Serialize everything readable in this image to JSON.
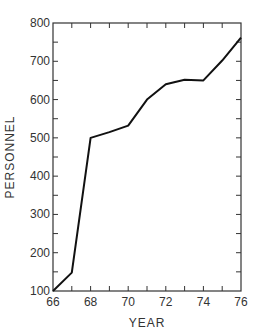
{
  "chart_data": {
    "type": "line",
    "title": "",
    "xlabel": "YEAR",
    "ylabel": "PERSONNEL",
    "x": [
      66,
      67,
      68,
      69,
      70,
      71,
      72,
      73,
      74,
      75,
      76
    ],
    "series": [
      {
        "name": "Personnel",
        "values": [
          100,
          148,
          500,
          515,
          532,
          600,
          640,
          652,
          650,
          702,
          762
        ]
      }
    ],
    "xlim": [
      66,
      76
    ],
    "ylim": [
      100,
      800
    ],
    "x_ticks": [
      "66",
      "68",
      "70",
      "72",
      "74",
      "76"
    ],
    "y_ticks": [
      "100",
      "200",
      "300",
      "400",
      "500",
      "600",
      "700",
      "800"
    ],
    "grid": false,
    "legend": "none",
    "line_color": "#111111"
  }
}
